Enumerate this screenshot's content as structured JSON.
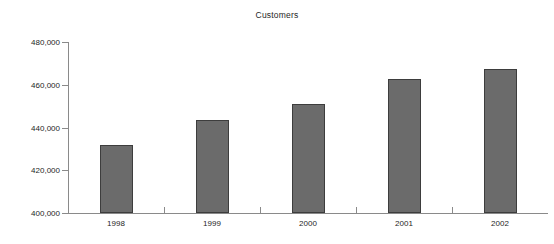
{
  "chart_data": {
    "type": "bar",
    "title": "Customers",
    "subtitle": "",
    "xlabel": "",
    "ylabel": "",
    "categories": [
      "1998",
      "1999",
      "2000",
      "2001",
      "2002"
    ],
    "values": [
      432000,
      443500,
      451000,
      462500,
      467500
    ],
    "series": [
      {
        "name": "Customers",
        "values": [
          432000,
          443500,
          451000,
          462500,
          467500
        ]
      }
    ],
    "ylim": [
      400000,
      480000
    ],
    "y_ticks": [
      400000,
      420000,
      440000,
      460000,
      480000
    ],
    "y_tick_labels": [
      "400,000",
      "420,000",
      "440,000",
      "460,000",
      "480,000"
    ],
    "grid": false,
    "legend": false,
    "legend_position": "none",
    "bar_color": "#6b6b6b",
    "bar_border_color": "#3d3d3d",
    "axis_color": "#8a8a8a",
    "text_color": "#262626",
    "background_color": "#ffffff"
  }
}
